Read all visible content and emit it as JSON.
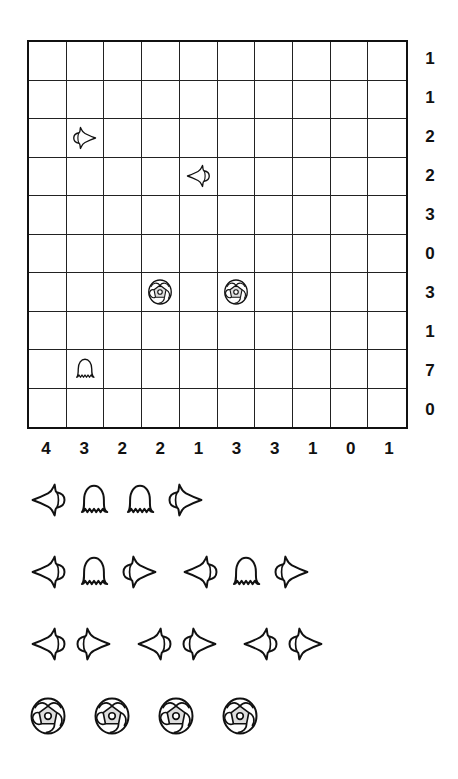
{
  "puzzle": {
    "type": "battleships",
    "size": {
      "rows": 10,
      "cols": 10
    },
    "row_clues": [
      "1",
      "1",
      "2",
      "2",
      "3",
      "0",
      "3",
      "1",
      "7",
      "0"
    ],
    "col_clues": [
      "4",
      "3",
      "2",
      "2",
      "1",
      "3",
      "3",
      "1",
      "0",
      "1"
    ],
    "given_pieces": [
      {
        "row": 2,
        "col": 1,
        "piece": "end-left"
      },
      {
        "row": 3,
        "col": 4,
        "piece": "end-right"
      },
      {
        "row": 6,
        "col": 3,
        "piece": "submarine"
      },
      {
        "row": 6,
        "col": 5,
        "piece": "submarine"
      },
      {
        "row": 8,
        "col": 1,
        "piece": "middle"
      }
    ]
  },
  "fleet": [
    {
      "length": 4,
      "count": 1,
      "pieces": [
        "end-right",
        "middle",
        "middle",
        "end-left"
      ]
    },
    {
      "length": 3,
      "count": 2,
      "pieces": [
        "end-right",
        "middle",
        "end-left"
      ]
    },
    {
      "length": 2,
      "count": 3,
      "pieces": [
        "end-right",
        "end-left"
      ]
    },
    {
      "length": 1,
      "count": 4,
      "pieces": [
        "submarine"
      ]
    }
  ],
  "icons": {
    "end-left": "tulip-pointing-right (left end of ship)",
    "end-right": "tulip-pointing-left (right end of ship)",
    "middle": "jellyfish (middle segment)",
    "submarine": "round shell (single cell ship)"
  }
}
